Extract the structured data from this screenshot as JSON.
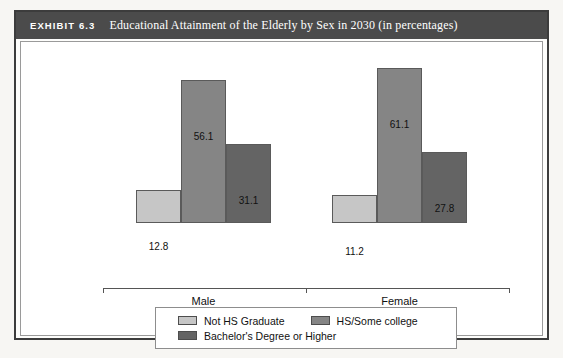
{
  "exhibit": {
    "tag": "EXHIBIT 6.3",
    "title": "Educational Attainment of the Elderly by Sex in 2030 (in percentages)"
  },
  "chart_data": {
    "type": "bar",
    "title": "Educational Attainment of the Elderly by Sex in 2030 (in percentages)",
    "xlabel": "",
    "ylabel": "",
    "ylim": [
      0,
      70
    ],
    "grid": false,
    "legend_position": "bottom",
    "categories": [
      "Male",
      "Female"
    ],
    "series": [
      {
        "name": "Not HS Graduate",
        "color": "#c6c6c6",
        "values": [
          12.8,
          11.2
        ]
      },
      {
        "name": "HS/Some college",
        "color": "#858585",
        "values": [
          56.1,
          61.1
        ]
      },
      {
        "name": "Bachelor's Degree or Higher",
        "color": "#646464",
        "values": [
          31.1,
          27.8
        ]
      }
    ],
    "data_labels": [
      "12.8",
      "56.1",
      "31.1",
      "11.2",
      "61.1",
      "27.8"
    ]
  },
  "legend": {
    "items": [
      {
        "label": "Not HS Graduate"
      },
      {
        "label": "HS/Some college"
      },
      {
        "label": "Bachelor's Degree or Higher"
      }
    ]
  },
  "axis": {
    "groups": [
      {
        "label": "Male"
      },
      {
        "label": "Female"
      }
    ]
  }
}
